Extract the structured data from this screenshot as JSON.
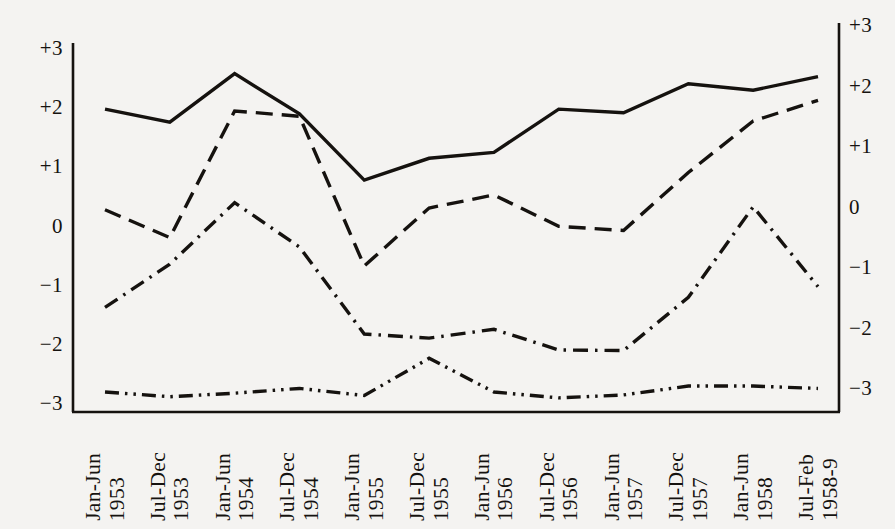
{
  "chart_data": {
    "type": "line",
    "title": "",
    "xlabel": "",
    "ylabel": "",
    "grid": false,
    "legend": "none",
    "axis_left": {
      "ticks": [
        "+3",
        "+2",
        "+1",
        "0",
        "−1",
        "−2",
        "−3"
      ],
      "values": [
        3,
        2,
        1,
        0,
        -1,
        -2,
        -3
      ],
      "ylim": [
        -3,
        3
      ]
    },
    "axis_right": {
      "ticks": [
        "+3",
        "+2",
        "+1",
        "0",
        "−1",
        "−2",
        "−3"
      ],
      "values": [
        3,
        2,
        1,
        0,
        -1,
        -2,
        -3
      ],
      "ylim": [
        -3,
        3
      ]
    },
    "categories": [
      "Jan-Jun 1953",
      "Jul-Dec 1953",
      "Jan-Jun 1954",
      "Jul-Dec 1954",
      "Jan-Jun 1955",
      "Jul-Dec 1955",
      "Jan-Jun 1956",
      "Jul-Dec 1956",
      "Jan-Jun 1957",
      "Jul-Dec 1957",
      "Jan-Jun 1958",
      "Jul-Feb 1958-9"
    ],
    "category_parts": [
      {
        "period": "Jan-Jun",
        "year": "1953"
      },
      {
        "period": "Jul-Dec",
        "year": "1953"
      },
      {
        "period": "Jan-Jun",
        "year": "1954"
      },
      {
        "period": "Jul-Dec",
        "year": "1954"
      },
      {
        "period": "Jan-Jun",
        "year": "1955"
      },
      {
        "period": "Jul-Dec",
        "year": "1955"
      },
      {
        "period": "Jan-Jun",
        "year": "1956"
      },
      {
        "period": "Jul-Dec",
        "year": "1956"
      },
      {
        "period": "Jan-Jun",
        "year": "1957"
      },
      {
        "period": "Jul-Dec",
        "year": "1957"
      },
      {
        "period": "Jan-Jun",
        "year": "1958"
      },
      {
        "period": "Jul-Feb",
        "year": "1958-9"
      }
    ],
    "series": [
      {
        "name": "series-solid",
        "style": "solid",
        "color": "#15120f",
        "values": [
          2.0,
          1.78,
          2.6,
          1.92,
          0.8,
          1.17,
          1.27,
          2.0,
          1.94,
          2.43,
          2.32,
          2.55
        ]
      },
      {
        "name": "series-dashed",
        "style": "dashed",
        "color": "#15120f",
        "values": [
          0.3,
          -0.17,
          1.97,
          1.88,
          -0.65,
          0.33,
          0.55,
          0.02,
          -0.05,
          0.93,
          1.8,
          2.15
        ]
      },
      {
        "name": "series-dash-dot",
        "style": "dash-dot",
        "color": "#15120f",
        "values": [
          -1.35,
          -0.62,
          0.42,
          -0.33,
          -1.8,
          -1.87,
          -1.72,
          -2.07,
          -2.08,
          -1.18,
          0.35,
          -1.0
        ]
      },
      {
        "name": "series-dash-dot-dot",
        "style": "dash-dot-dot",
        "color": "#15120f",
        "values": [
          -2.78,
          -2.86,
          -2.8,
          -2.72,
          -2.84,
          -2.21,
          -2.78,
          -2.88,
          -2.83,
          -2.68,
          -2.68,
          -2.72
        ]
      }
    ]
  }
}
